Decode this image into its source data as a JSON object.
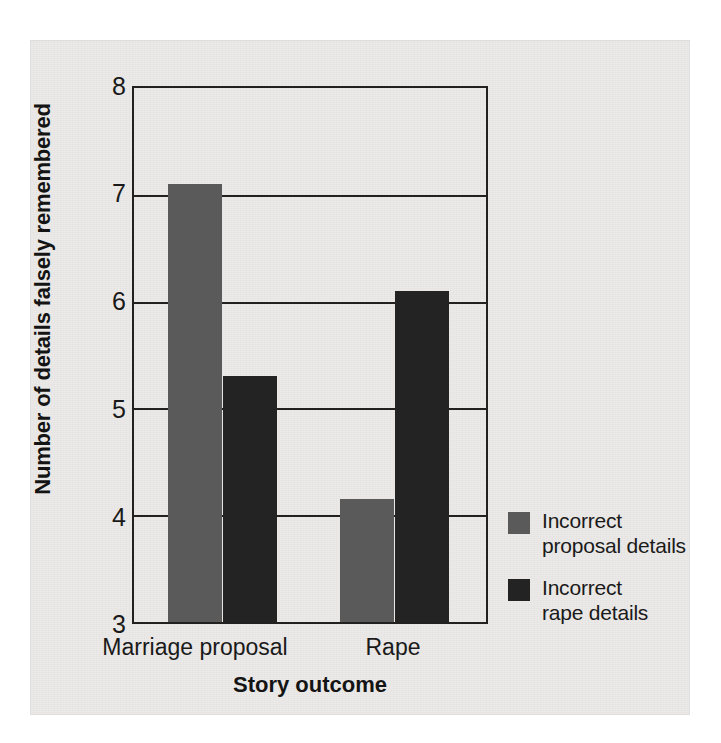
{
  "chart_data": {
    "type": "bar",
    "title": "",
    "xlabel": "Story outcome",
    "ylabel": "Number of details falsely remembered",
    "categories": [
      "Marriage proposal",
      "Rape"
    ],
    "series": [
      {
        "name": "Incorrect proposal details",
        "color": "#5a5a5a",
        "values": [
          7.1,
          4.15
        ]
      },
      {
        "name": "Incorrect rape details",
        "color": "#232323",
        "values": [
          5.3,
          6.1
        ]
      }
    ],
    "ylim": [
      3,
      8
    ],
    "yticks": [
      3,
      4,
      5,
      6,
      7,
      8
    ],
    "ytick_labels": [
      "3",
      "4",
      "5",
      "6",
      "7",
      "8"
    ],
    "grid": true,
    "legend_position": "right-bottom"
  },
  "axes": {
    "y_tick_3": "3",
    "y_tick_4": "4",
    "y_tick_5": "5",
    "y_tick_6": "6",
    "y_tick_7": "7",
    "y_tick_8": "8",
    "y_axis_title": "Number of details falsely remembered",
    "x_tick_1": "Marriage proposal",
    "x_tick_2": "Rape",
    "x_axis_title": "Story outcome"
  },
  "legend": {
    "entries": [
      {
        "label_line1": "Incorrect",
        "label_line2": "proposal details",
        "color": "#5a5a5a"
      },
      {
        "label_line1": "Incorrect",
        "label_line2": "rape details",
        "color": "#232323"
      }
    ]
  },
  "colors": {
    "series_proposal": "#5a5a5a",
    "series_rape": "#232323",
    "axis": "#23211f",
    "page_background": "#eceae8"
  }
}
